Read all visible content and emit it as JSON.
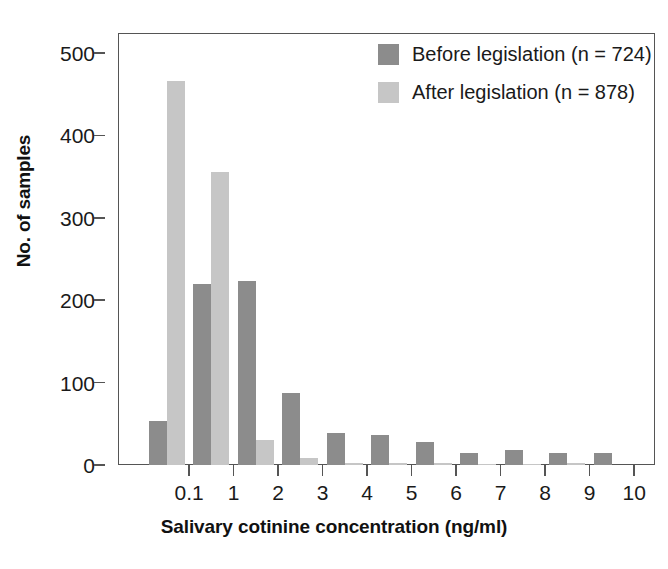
{
  "chart_data": {
    "type": "bar",
    "title": "",
    "subtitle": "",
    "xlabel": "Salivary cotinine concentration (ng/ml)",
    "ylabel": "No. of samples",
    "xtick_labels": [
      "0.1",
      "1",
      "2",
      "3",
      "4",
      "5",
      "6",
      "7",
      "8",
      "9",
      "10"
    ],
    "ytick_labels": [
      "0",
      "100",
      "200",
      "300",
      "400",
      "500"
    ],
    "ytick_values": [
      0,
      100,
      200,
      300,
      400,
      500
    ],
    "ylim": [
      0,
      520
    ],
    "grid": false,
    "legend_position": "top-right",
    "categories": [
      "<0.1",
      "0.1-1",
      "1-2",
      "2-3",
      "3-4",
      "4-5",
      "5-6",
      "6-7",
      "7-8",
      "8-9",
      "9-10"
    ],
    "series": [
      {
        "name": "Before legislation (n = 724)",
        "color": "#8c8c8c",
        "values": [
          54,
          220,
          223,
          87,
          39,
          37,
          28,
          15,
          18,
          15,
          14
        ]
      },
      {
        "name": "After legislation (n = 878)",
        "color": "#c6c6c6",
        "values": [
          466,
          356,
          30,
          8,
          3,
          2,
          2,
          1,
          1,
          2,
          0
        ]
      }
    ]
  },
  "legend": {
    "items": [
      {
        "label": "Before legislation (n = 724)",
        "color": "#8c8c8c"
      },
      {
        "label": "After legislation (n = 878)",
        "color": "#c6c6c6"
      }
    ]
  },
  "axes": {
    "x_title": "Salivary cotinine concentration (ng/ml)",
    "y_title": "No. of samples"
  },
  "colors": {
    "before": "#8c8c8c",
    "after": "#c6c6c6",
    "axis": "#555555",
    "text": "#1a1a1a",
    "background": "#ffffff"
  }
}
